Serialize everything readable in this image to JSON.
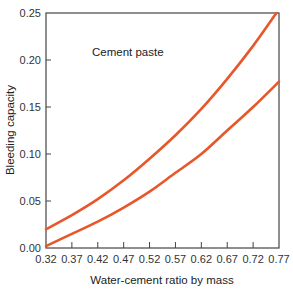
{
  "chart_data": {
    "type": "line",
    "title": "",
    "annotation": "Cement paste",
    "xlabel": "Water-cement ratio by mass",
    "ylabel": "Bleeding capacity",
    "xlim": [
      0.32,
      0.77
    ],
    "ylim": [
      0.0,
      0.25
    ],
    "xticks": [
      "0.32",
      "0.37",
      "0.42",
      "0.47",
      "0.52",
      "0.57",
      "0.62",
      "0.67",
      "0.72",
      "0.77"
    ],
    "yticks": [
      "0.00",
      "0.05",
      "0.10",
      "0.15",
      "0.20",
      "0.25"
    ],
    "grid": false,
    "legend": null,
    "line_color": "#e8572a",
    "series": [
      {
        "name": "Upper curve",
        "x": [
          0.32,
          0.37,
          0.42,
          0.47,
          0.52,
          0.57,
          0.62,
          0.67,
          0.72,
          0.765
        ],
        "values": [
          0.02,
          0.035,
          0.052,
          0.072,
          0.095,
          0.12,
          0.148,
          0.18,
          0.215,
          0.25
        ]
      },
      {
        "name": "Lower curve",
        "x": [
          0.32,
          0.37,
          0.42,
          0.47,
          0.52,
          0.57,
          0.62,
          0.67,
          0.72,
          0.77
        ],
        "values": [
          0.002,
          0.015,
          0.028,
          0.043,
          0.06,
          0.08,
          0.1,
          0.125,
          0.15,
          0.177
        ]
      }
    ]
  }
}
